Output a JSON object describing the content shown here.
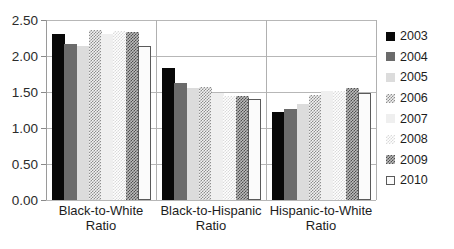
{
  "chart_data": {
    "type": "bar",
    "title": "",
    "subtitle": "",
    "xlabel": "",
    "ylabel": "",
    "ylim": [
      0.0,
      2.5
    ],
    "ytick_labels": [
      "0.00",
      "0.50",
      "1.00",
      "1.50",
      "2.00",
      "2.50"
    ],
    "ytick_values": [
      0.0,
      0.5,
      1.0,
      1.5,
      2.0,
      2.5
    ],
    "grid": true,
    "legend_position": "right",
    "categories": [
      "Black-to-White\nRatio",
      "Black-to-Hispanic\nRatio",
      "Hispanic-to-White\nRatio"
    ],
    "series": [
      {
        "name": "2003",
        "values": [
          2.3,
          1.84,
          1.22
        ],
        "color": "#080808",
        "pattern": "solid-black"
      },
      {
        "name": "2004",
        "values": [
          2.16,
          1.63,
          1.27
        ],
        "color": "#6b6b6b",
        "pattern": "solid-dark-gray"
      },
      {
        "name": "2005",
        "values": [
          2.14,
          1.55,
          1.33
        ],
        "color": "#dcdcdc",
        "pattern": "solid-light-gray"
      },
      {
        "name": "2006",
        "values": [
          2.36,
          1.57,
          1.46
        ],
        "color": "#8d8d8d",
        "pattern": "checker-medium"
      },
      {
        "name": "2007",
        "values": [
          2.3,
          1.48,
          1.51
        ],
        "color": "#efefef",
        "pattern": "solid-very-light-gray"
      },
      {
        "name": "2008",
        "values": [
          2.35,
          1.44,
          1.52
        ],
        "color": "#dadada",
        "pattern": "checker-light"
      },
      {
        "name": "2009",
        "values": [
          2.34,
          1.44,
          1.56
        ],
        "color": "#4f4f4f",
        "pattern": "checker-dark"
      },
      {
        "name": "2010",
        "values": [
          2.14,
          1.4,
          1.48
        ],
        "color": "#ffffff",
        "pattern": "outlined-white"
      }
    ]
  },
  "legend": {
    "items": [
      {
        "label": "2003"
      },
      {
        "label": "2004"
      },
      {
        "label": "2005"
      },
      {
        "label": "2006"
      },
      {
        "label": "2007"
      },
      {
        "label": "2008"
      },
      {
        "label": "2009"
      },
      {
        "label": "2010"
      }
    ]
  }
}
